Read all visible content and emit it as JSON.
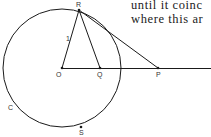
{
  "text": {
    "line1": "until it coinc",
    "line2": "where this ar"
  },
  "diagram": {
    "labels": {
      "R": "R",
      "O": "O",
      "Q": "Q",
      "P": "P",
      "C": "C",
      "S": "S",
      "radius": "1"
    },
    "circle": {
      "cx": 62,
      "cy": 68,
      "r": 59
    },
    "points": {
      "O": [
        62,
        68
      ],
      "Q": [
        100,
        68
      ],
      "P": [
        158,
        68
      ],
      "R": [
        79,
        10
      ],
      "S": [
        81,
        127
      ]
    },
    "stroke_color": "#1a1a1a"
  }
}
